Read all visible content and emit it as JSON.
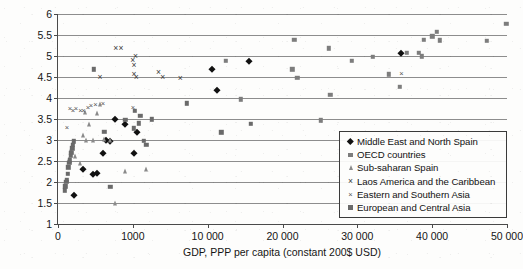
{
  "chart_data": {
    "type": "scatter",
    "title": "",
    "xlabel": "GDP, PPP per capita (constant 200$ USD)",
    "ylabel": "Mean life satisfaction",
    "grid": true,
    "legend_position": "lower-right inside plot",
    "ylim": [
      1,
      6
    ],
    "yticks": [
      "1",
      "1.5",
      "2",
      "2.5",
      "3",
      "3.5",
      "4",
      "4.5",
      "5",
      "5.5",
      "6"
    ],
    "ytick_values": [
      1,
      1.5,
      2,
      2.5,
      3,
      3.5,
      4,
      4.5,
      5,
      5.5,
      6
    ],
    "xticks": [
      "0",
      "1000",
      "10 000",
      "20 000",
      "30 000",
      "40 000",
      "50 000"
    ],
    "xtick_values": [
      0,
      1000,
      10000,
      20000,
      30000,
      40000,
      50000
    ],
    "xtick_note": "Tick labels are evenly spaced on the axis; the second label reads 1000 as printed.",
    "series": [
      {
        "name": "Middle East and North Spain",
        "marker": "diamond",
        "color": "#111111",
        "points": [
          [
            220,
            1.7
          ],
          [
            330,
            2.3
          ],
          [
            470,
            2.2
          ],
          [
            520,
            2.22
          ],
          [
            600,
            2.69
          ],
          [
            640,
            2.99
          ],
          [
            700,
            2.98
          ],
          [
            760,
            3.49
          ],
          [
            900,
            3.39
          ],
          [
            1150,
            2.7
          ],
          [
            1500,
            3.18
          ],
          [
            10600,
            4.68
          ],
          [
            11300,
            4.19
          ],
          [
            15500,
            4.89
          ],
          [
            35800,
            5.08
          ]
        ]
      },
      {
        "name": "OECD countries",
        "marker": "square",
        "color": "#7d7d7d",
        "points": [
          [
            12400,
            4.89
          ],
          [
            14400,
            3.97
          ],
          [
            21300,
            4.68
          ],
          [
            21600,
            5.38
          ],
          [
            22000,
            4.48
          ],
          [
            25100,
            3.47
          ],
          [
            26200,
            5.18
          ],
          [
            26400,
            4.08
          ],
          [
            29300,
            4.89
          ],
          [
            32100,
            4.98
          ],
          [
            34200,
            4.56
          ],
          [
            35700,
            4.27
          ],
          [
            36600,
            5.08
          ],
          [
            38200,
            5.08
          ],
          [
            38600,
            4.99
          ],
          [
            38900,
            5.38
          ],
          [
            40000,
            5.47
          ],
          [
            40600,
            5.57
          ],
          [
            41000,
            5.37
          ],
          [
            47300,
            5.36
          ],
          [
            49900,
            5.77
          ]
        ]
      },
      {
        "name": "Sub-saharan Spain",
        "marker": "triangle",
        "color": "#8a8a8a",
        "points": [
          [
            150,
            2.55
          ],
          [
            180,
            2.78
          ],
          [
            200,
            2.96
          ],
          [
            230,
            2.62
          ],
          [
            300,
            2.46
          ],
          [
            330,
            3.12
          ],
          [
            360,
            3.66
          ],
          [
            380,
            2.99
          ],
          [
            420,
            3.38
          ],
          [
            470,
            3.0
          ],
          [
            520,
            3.64
          ],
          [
            560,
            3.85
          ],
          [
            620,
            3.02
          ],
          [
            700,
            2.99
          ],
          [
            760,
            1.49
          ],
          [
            900,
            2.27
          ],
          [
            2600,
            2.3
          ]
        ]
      },
      {
        "name": "Laos America and the Caribbean",
        "marker": "x-large",
        "color": "#3a3a3a",
        "points": [
          [
            560,
            4.49
          ],
          [
            770,
            5.19
          ],
          [
            840,
            5.19
          ],
          [
            1000,
            4.9
          ],
          [
            1130,
            4.78
          ],
          [
            1150,
            4.57
          ],
          [
            1310,
            4.99
          ],
          [
            1400,
            4.49
          ],
          [
            4100,
            4.62
          ],
          [
            4600,
            4.49
          ],
          [
            6700,
            4.48
          ]
        ]
      },
      {
        "name": "Eastern and Southern Asia",
        "marker": "x-small",
        "color": "#555555",
        "points": [
          [
            120,
            3.29
          ],
          [
            160,
            3.74
          ],
          [
            200,
            3.69
          ],
          [
            240,
            3.73
          ],
          [
            300,
            3.68
          ],
          [
            340,
            3.7
          ],
          [
            400,
            3.77
          ],
          [
            440,
            3.8
          ],
          [
            500,
            3.83
          ],
          [
            600,
            3.86
          ],
          [
            1000,
            3.77
          ],
          [
            35900,
            4.56
          ]
        ]
      },
      {
        "name": "European and Central Asia",
        "marker": "square-dark",
        "color": "#6a6a6a",
        "points": [
          [
            90,
            1.8
          ],
          [
            100,
            1.9
          ],
          [
            110,
            2.0
          ],
          [
            120,
            2.05
          ],
          [
            130,
            2.2
          ],
          [
            140,
            2.35
          ],
          [
            150,
            2.45
          ],
          [
            160,
            2.52
          ],
          [
            170,
            2.62
          ],
          [
            180,
            2.7
          ],
          [
            190,
            2.8
          ],
          [
            200,
            2.88
          ],
          [
            210,
            2.97
          ],
          [
            480,
            4.68
          ],
          [
            620,
            3.2
          ],
          [
            700,
            1.88
          ],
          [
            900,
            3.48
          ],
          [
            1100,
            3.28
          ],
          [
            1250,
            3.7
          ],
          [
            1700,
            3.4
          ],
          [
            1900,
            3.58
          ],
          [
            2300,
            2.98
          ],
          [
            2600,
            2.89
          ],
          [
            3300,
            3.49
          ],
          [
            7500,
            3.87
          ],
          [
            11800,
            3.18
          ],
          [
            15800,
            3.38
          ]
        ]
      }
    ]
  }
}
